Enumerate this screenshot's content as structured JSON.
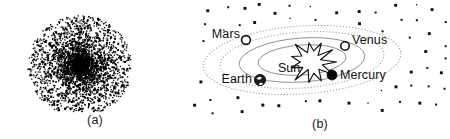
{
  "figure": {
    "width": 450,
    "height": 139,
    "background_color": "#ffffff"
  },
  "panel_a": {
    "caption": "(a)",
    "kind": "scatter-point-cloud",
    "description": "Radially symmetric dense point cloud with saturated black core",
    "center": {
      "x": 80,
      "y": 66
    },
    "outer_radius": 52,
    "core_radius": 8,
    "point_count": 3600,
    "point_color": "#000000",
    "point_size_px": 1.3
  },
  "panel_b": {
    "caption": "(b)",
    "kind": "solar-system-diagram",
    "sun": {
      "label": "Sun",
      "label_x": 88,
      "label_y": 72,
      "center_x": 122,
      "center_y": 62,
      "stroke_color": "#111111"
    },
    "planets": [
      {
        "name": "Mars",
        "label": "Mars",
        "marker": "hollow-circle",
        "marker_x": 56,
        "marker_y": 40,
        "marker_r": 4.4,
        "label_x": 50,
        "label_y": 38,
        "label_anchor": "end",
        "fill": "#ffffff",
        "stroke": "#111111"
      },
      {
        "name": "Venus",
        "label": "Venus",
        "marker": "hollow-circle",
        "marker_x": 155,
        "marker_y": 46,
        "marker_r": 4.2,
        "label_x": 162,
        "label_y": 44,
        "label_anchor": "start",
        "fill": "#ffffff",
        "stroke": "#111111"
      },
      {
        "name": "Earth",
        "label": "Earth",
        "marker": "globe-circle",
        "marker_x": 70,
        "marker_y": 80,
        "marker_r": 5.6,
        "label_x": 62,
        "label_y": 83,
        "label_anchor": "end",
        "fill": "#1b1b1b",
        "stroke": "#111111"
      },
      {
        "name": "Mercury",
        "label": "Mercury",
        "marker": "filled-circle",
        "marker_x": 142,
        "marker_y": 75,
        "marker_r": 5.0,
        "label_x": 150,
        "label_y": 79,
        "label_anchor": "start",
        "fill": "#0a0a0a",
        "stroke": "#0a0a0a"
      }
    ],
    "orbits": [
      {
        "rx": 99,
        "ry": 34,
        "style": "dotted",
        "stroke": "#9a9a9a"
      },
      {
        "rx": 82,
        "ry": 28,
        "style": "dotted",
        "stroke": "#9a9a9a"
      },
      {
        "rx": 63,
        "ry": 22,
        "style": "solid",
        "stroke": "#8d8d8d"
      },
      {
        "rx": 44,
        "ry": 15,
        "style": "solid",
        "stroke": "#8d8d8d"
      }
    ],
    "orbit_center": {
      "x": 112,
      "y": 60
    },
    "orbit_rotation_deg": -4,
    "star_field": {
      "star_color": "#111111",
      "count": 54
    }
  }
}
